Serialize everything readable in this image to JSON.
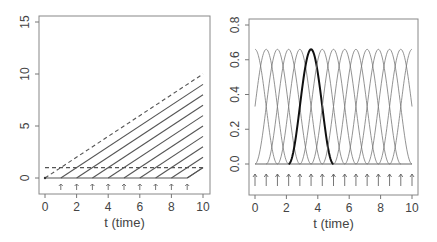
{
  "chart_data": [
    {
      "type": "line",
      "title": "",
      "xlabel": "t (time)",
      "ylabel": "",
      "xlim": [
        0,
        10
      ],
      "ylim": [
        -2,
        15.5
      ],
      "xticks": [
        0,
        2,
        4,
        6,
        8,
        10
      ],
      "yticks": [
        0,
        5,
        10,
        15
      ],
      "grid": false,
      "legend": null,
      "series": [
        {
          "name": "ramp-1",
          "style": "solid",
          "start": 1,
          "points": [
            [
              1,
              0
            ],
            [
              10,
              9
            ]
          ]
        },
        {
          "name": "ramp-2",
          "style": "solid",
          "start": 2,
          "points": [
            [
              2,
              0
            ],
            [
              10,
              8
            ]
          ]
        },
        {
          "name": "ramp-3",
          "style": "solid",
          "start": 3,
          "points": [
            [
              3,
              0
            ],
            [
              10,
              7
            ]
          ]
        },
        {
          "name": "ramp-4",
          "style": "solid",
          "start": 4,
          "points": [
            [
              4,
              0
            ],
            [
              10,
              6
            ]
          ]
        },
        {
          "name": "ramp-5",
          "style": "solid",
          "start": 5,
          "points": [
            [
              5,
              0
            ],
            [
              10,
              5
            ]
          ]
        },
        {
          "name": "ramp-6",
          "style": "solid",
          "start": 6,
          "points": [
            [
              6,
              0
            ],
            [
              10,
              4
            ]
          ]
        },
        {
          "name": "ramp-7",
          "style": "solid",
          "start": 7,
          "points": [
            [
              7,
              0
            ],
            [
              10,
              3
            ]
          ]
        },
        {
          "name": "ramp-8",
          "style": "solid",
          "start": 8,
          "points": [
            [
              8,
              0
            ],
            [
              10,
              2
            ]
          ]
        },
        {
          "name": "ramp-9",
          "style": "solid",
          "start": 9,
          "points": [
            [
              9,
              0
            ],
            [
              10,
              1
            ]
          ]
        },
        {
          "name": "baseline",
          "style": "solid",
          "points": [
            [
              0,
              0
            ],
            [
              9,
              0
            ]
          ]
        },
        {
          "name": "upper-dashed",
          "style": "dashed",
          "points": [
            [
              0,
              0
            ],
            [
              1,
              1
            ],
            [
              10,
              10
            ]
          ]
        },
        {
          "name": "constant-dashed",
          "style": "dashed",
          "points": [
            [
              0,
              1
            ],
            [
              10,
              1
            ]
          ]
        }
      ],
      "arrows_x": [
        1,
        2,
        3,
        4,
        5,
        6,
        7,
        8,
        9
      ]
    },
    {
      "type": "line",
      "title": "",
      "xlabel": "t (time)",
      "ylabel": "",
      "xlim": [
        0,
        10
      ],
      "ylim": [
        -0.2,
        0.8
      ],
      "xticks": [
        0,
        2,
        4,
        6,
        8,
        10
      ],
      "yticks": [
        0.0,
        0.2,
        0.4,
        0.6,
        0.8
      ],
      "ytick_labels": [
        "0.0",
        "0.2",
        "0.4",
        "0.6",
        "0.8"
      ],
      "grid": false,
      "legend": null,
      "basis": "bell-shaped kernel bumps",
      "peak_height": 0.66,
      "half_width": 1.43,
      "centers": [
        0,
        0.714,
        1.429,
        2.143,
        2.857,
        3.571,
        4.286,
        5.0,
        5.714,
        6.429,
        7.143,
        7.857,
        8.571,
        9.286,
        10
      ],
      "highlighted_center": 3.571,
      "arrows_x": [
        0,
        0.714,
        1.429,
        2.143,
        2.857,
        3.571,
        4.286,
        5.0,
        5.714,
        6.429,
        7.143,
        7.857,
        8.571,
        9.286,
        10
      ]
    }
  ]
}
